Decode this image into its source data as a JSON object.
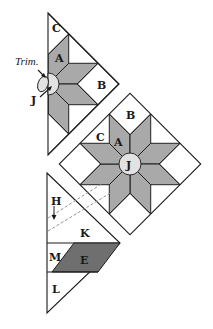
{
  "figure": {
    "colors": {
      "star_fill": "#a9a9a9",
      "center_fill": "#e2e2e2",
      "dark_piece_fill": "#6f6f6f",
      "background_piece_fill": "#ffffff",
      "line": "#1a1a1a"
    },
    "top_triangle": {
      "labels": {
        "c": "C",
        "a": "A",
        "b": "B",
        "j": "J"
      },
      "annotation": "Trim."
    },
    "diamond_block": {
      "labels": {
        "b": "B",
        "c": "C",
        "a": "A",
        "j": "J"
      }
    },
    "bottom_triangle": {
      "labels": {
        "h": "H",
        "k": "K",
        "m": "M",
        "e": "E",
        "l": "L"
      }
    }
  }
}
